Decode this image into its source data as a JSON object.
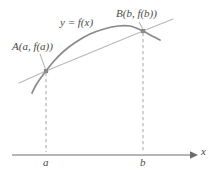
{
  "figure": {
    "kind": "calculus-secant-line-diagram",
    "background_color": "#ffffff",
    "curve_color": "#8a8a8a",
    "secant_color": "#b8b8b8",
    "axis_color": "#6e6e6e",
    "dash_color": "#9a9a9a",
    "marker_color": "#8a8a8a",
    "label_color": "#4a4a4a",
    "labels": {
      "point_a": "A(a, f(a))",
      "point_b": "B(b, f(b))",
      "function": "y = f(x)",
      "tick_a": "a",
      "tick_b": "b",
      "axis_x": "x"
    }
  },
  "chart_data": {
    "type": "line",
    "title": "",
    "xlabel": "x",
    "ylabel": "",
    "grid": false,
    "legend": "none",
    "annotations": [
      {
        "name": "point-a-label",
        "text": "A(a, f(a))",
        "x": 46,
        "y": 71
      },
      {
        "name": "point-b-label",
        "text": "B(b, f(b))",
        "x": 143,
        "y": 31
      },
      {
        "name": "function-label",
        "text": "y = f(x)",
        "x": 82,
        "y": 23
      }
    ],
    "xticks": [
      "a",
      "b"
    ],
    "xtick_positions": [
      46,
      143
    ],
    "series": [
      {
        "name": "y = f(x)",
        "type": "curve",
        "color": "#8a8a8a",
        "points": [
          [
            32,
            93
          ],
          [
            36,
            85
          ],
          [
            40,
            79
          ],
          [
            46,
            71
          ],
          [
            54,
            61
          ],
          [
            64,
            51
          ],
          [
            76,
            42
          ],
          [
            90,
            34
          ],
          [
            104,
            29
          ],
          [
            118,
            26
          ],
          [
            130,
            26
          ],
          [
            143,
            31
          ],
          [
            152,
            36
          ],
          [
            160,
            40
          ]
        ]
      },
      {
        "name": "secant line AB",
        "type": "line",
        "color": "#b8b8b8",
        "points": [
          [
            19,
            83
          ],
          [
            46,
            71
          ],
          [
            143,
            31
          ],
          [
            173,
            19
          ]
        ]
      }
    ],
    "markers": [
      {
        "name": "point-a-marker",
        "x": 46,
        "y": 71,
        "shape": "square"
      },
      {
        "name": "point-b-marker",
        "x": 143,
        "y": 31,
        "shape": "square"
      }
    ],
    "dashed_drop_lines": [
      {
        "name": "drop-line-a",
        "x": 46,
        "y_top": 73,
        "y_bottom": 152
      },
      {
        "name": "drop-line-b",
        "x": 143,
        "y_top": 33,
        "y_bottom": 152
      }
    ],
    "axis": {
      "y": 155,
      "x_start": 12,
      "x_end": 197,
      "arrow": true
    }
  }
}
